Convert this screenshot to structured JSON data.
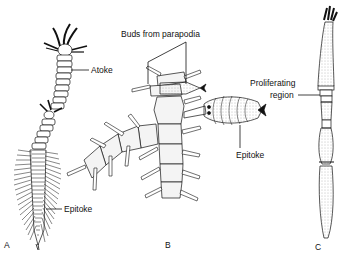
{
  "figure": {
    "panels": [
      {
        "id": "A",
        "label": "A",
        "annotations": [
          "Atoke",
          "Epitoke"
        ]
      },
      {
        "id": "B",
        "label": "B",
        "annotations": [
          "Buds from parapodia",
          "Epitoke"
        ]
      },
      {
        "id": "C",
        "label": "C",
        "annotations": [
          "Proliferating region"
        ]
      }
    ],
    "labels": {
      "a_atoke": "Atoke",
      "a_epitoke": "Epitoke",
      "a_panel": "A",
      "b_buds": "Buds from parapodia",
      "b_epitoke": "Epitoke",
      "b_panel": "B",
      "c_prolif_1": "Proliferating",
      "c_prolif_2": "region",
      "c_panel": "C"
    },
    "colors": {
      "line": "#111111",
      "fill": "#f3f3f3",
      "stipple": "#888888",
      "background": "#ffffff"
    }
  }
}
